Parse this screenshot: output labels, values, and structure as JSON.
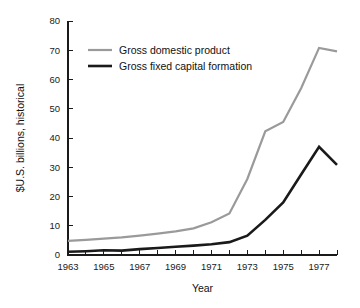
{
  "chart_data": {
    "type": "line",
    "title": "",
    "xlabel": "Year",
    "ylabel": "$U.S. billions, historical",
    "x": [
      1963,
      1964,
      1965,
      1966,
      1967,
      1968,
      1969,
      1970,
      1971,
      1972,
      1973,
      1974,
      1975,
      1976,
      1977,
      1978
    ],
    "xlim": [
      1963,
      1978
    ],
    "ylim": [
      0,
      80
    ],
    "xticks": [
      1963,
      1964,
      1965,
      1966,
      1967,
      1968,
      1969,
      1970,
      1971,
      1972,
      1973,
      1974,
      1975,
      1976,
      1977,
      1978
    ],
    "xtick_labels": [
      "1963",
      "",
      "1965",
      "",
      "1967",
      "",
      "1969",
      "",
      "1971",
      "",
      "1973",
      "",
      "1975",
      "",
      "1977",
      ""
    ],
    "yticks": [
      0,
      10,
      20,
      30,
      40,
      50,
      60,
      70,
      80
    ],
    "ytick_labels": [
      "0",
      "10",
      "20",
      "30",
      "40",
      "50",
      "60",
      "70",
      "80"
    ],
    "grid": false,
    "legend_position": "upper-left-inside",
    "series": [
      {
        "name": "Gross domestic product",
        "color": "#9a9a9a",
        "width": 2.2,
        "values": [
          4.8,
          5.2,
          5.6,
          6.0,
          6.6,
          7.3,
          8.1,
          9.1,
          11.2,
          14.2,
          26.0,
          42.3,
          45.5,
          57.0,
          70.8,
          69.6
        ]
      },
      {
        "name": "Gross fixed capital formation",
        "color": "#1a1a1a",
        "width": 2.6,
        "values": [
          1.1,
          1.3,
          1.6,
          1.5,
          2.0,
          2.4,
          2.8,
          3.2,
          3.7,
          4.4,
          6.6,
          12.0,
          18.0,
          27.5,
          37.0,
          30.8
        ]
      }
    ]
  },
  "axes": {
    "y_axis_title": "$U.S. billions, historical",
    "x_axis_title": "Year"
  },
  "legend": {
    "items": [
      {
        "label": "Gross domestic product",
        "color": "#9a9a9a"
      },
      {
        "label": "Gross fixed capital formation",
        "color": "#1a1a1a"
      }
    ]
  }
}
